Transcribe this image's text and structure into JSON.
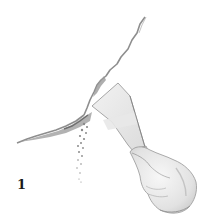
{
  "illustration": {
    "subject": "hand scraping out a wall crack with a putty knife",
    "step_number": "1",
    "colors": {
      "background": "#ffffff",
      "pencil_dark": "#6e6e6e",
      "pencil_mid": "#9a9a9a",
      "pencil_light": "#cfcfcf",
      "numeral": "#1a1a1a"
    }
  }
}
